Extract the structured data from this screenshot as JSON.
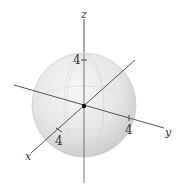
{
  "diagram": {
    "type": "3d-sphere-with-axes",
    "sphere": {
      "radius_label": "4",
      "fill_light": "#f4f4f4",
      "fill_dark": "#c9c9c9",
      "stroke": "#bdbdbd"
    },
    "axes": {
      "x": {
        "label": "x",
        "tick_label": "4"
      },
      "y": {
        "label": "y",
        "tick_label": "4"
      },
      "z": {
        "label": "z",
        "tick_label": "4"
      }
    },
    "axis_color": "#555555",
    "origin_color": "#111111"
  }
}
